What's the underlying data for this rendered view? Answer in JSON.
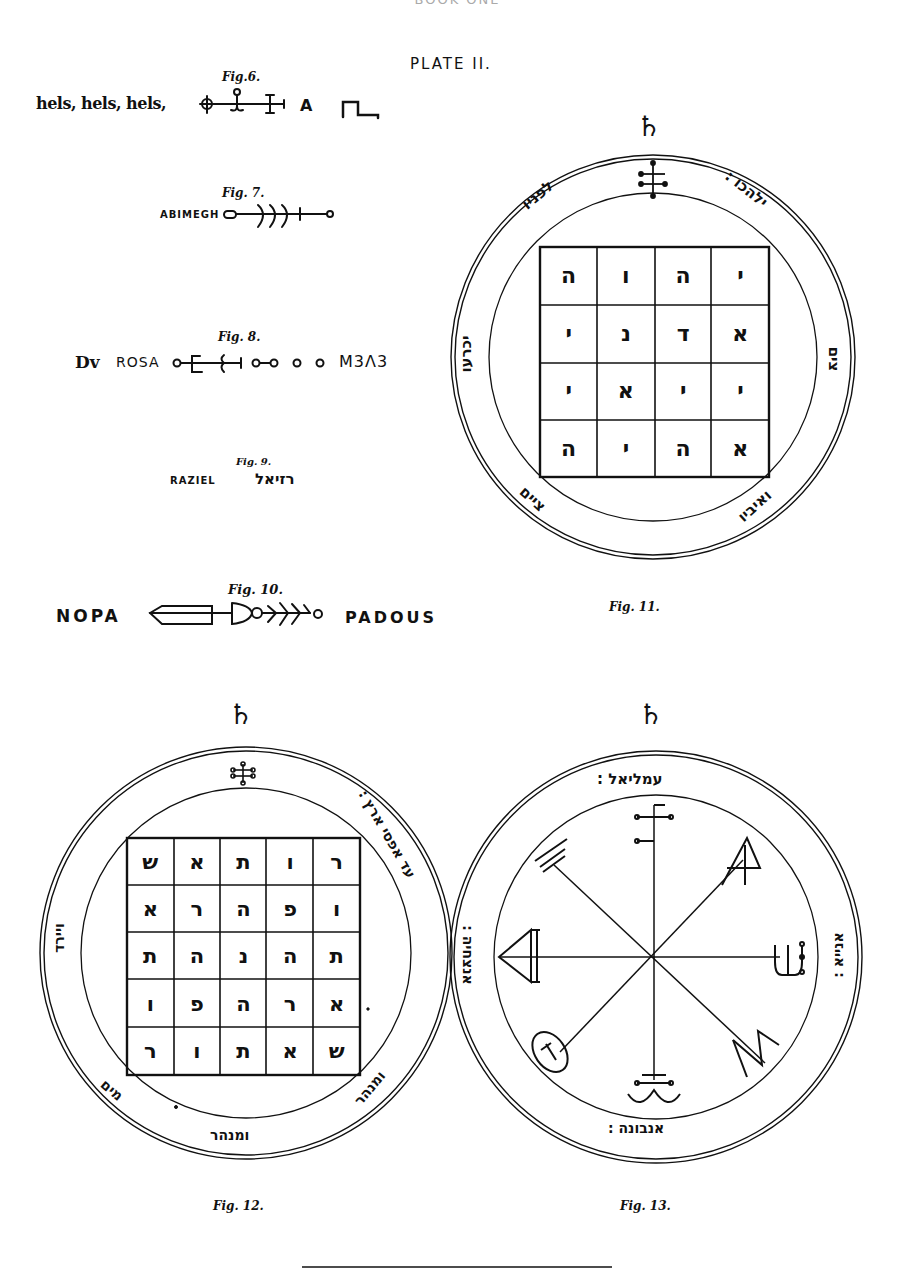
{
  "page": {
    "header": "BOOK ONE",
    "plate_title": "PLATE II.",
    "rule": true
  },
  "figures": {
    "fig6": {
      "label": "Fig.6.",
      "text": "hels, hels, hels,",
      "tail": "A"
    },
    "fig7": {
      "label": "Fig. 7.",
      "text": "ABIMEGH"
    },
    "fig8": {
      "label": "Fig. 8.",
      "prefix": "Dv",
      "text": "ROSA",
      "suffix": "M3Λ3"
    },
    "fig9": {
      "label": "Fig. 9.",
      "text": "RAZIEL",
      "hebrew": "רזיאל"
    },
    "fig10": {
      "label": "Fig. 10.",
      "left_text": "NOPA",
      "right_text": "PADOUS"
    },
    "fig11": {
      "label": "Fig. 11.",
      "planet_symbol": "♄",
      "ring_text": {
        "upper_left": "לפניו",
        "upper_right": "ילהכו :",
        "left": "יכרעו",
        "right": "צים",
        "lower_left": "ציים",
        "lower_right": "ואיביו"
      },
      "grid": [
        [
          "ה",
          "ו",
          "ה",
          "י"
        ],
        [
          "י",
          "נ",
          "ד",
          "א"
        ],
        [
          "י",
          "א",
          "י",
          "י"
        ],
        [
          "ה",
          "י",
          "ה",
          "א"
        ]
      ]
    },
    "fig12": {
      "label": "Fig. 12.",
      "planet_symbol": "♄",
      "ring_text": {
        "upper_right": "עד אפסי ארץ :",
        "left": "ויירד",
        "lower_left": "מים",
        "bottom": "ומנהר",
        "lower_right": "ומנהר"
      },
      "grid": [
        [
          "ש",
          "א",
          "ת",
          "ו",
          "ר"
        ],
        [
          "א",
          "ר",
          "ה",
          "פ",
          "ו"
        ],
        [
          "ת",
          "ה",
          "נ",
          "ה",
          "ת"
        ],
        [
          "ו",
          "פ",
          "ה",
          "ר",
          "א"
        ],
        [
          "ר",
          "ו",
          "ת",
          "א",
          "ש"
        ]
      ]
    },
    "fig13": {
      "label": "Fig. 13.",
      "planet_symbol": "♄",
      "ring_text": {
        "top": "עמליאל :",
        "left": "אנצחיה :",
        "right": "אנייא :",
        "bottom": "אנבונה :"
      }
    }
  },
  "colors": {
    "ink": "#111111",
    "paper": "#ffffff",
    "faint": "#aaaaaa"
  }
}
